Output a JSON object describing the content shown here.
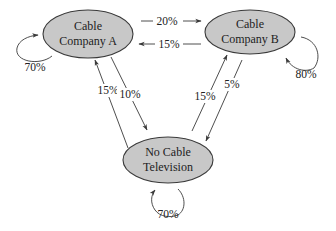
{
  "diagram": {
    "type": "state-transition",
    "nodes": [
      {
        "id": "A",
        "line1": "Cable",
        "line2": "Company A",
        "fill": "#c8c8c8"
      },
      {
        "id": "B",
        "line1": "Cable",
        "line2": "Company B",
        "fill": "#c8c8c8"
      },
      {
        "id": "C",
        "line1": "No Cable",
        "line2": "Television",
        "fill": "#c8c8c8"
      }
    ],
    "edges": [
      {
        "from": "A",
        "to": "B",
        "label": "20%"
      },
      {
        "from": "B",
        "to": "A",
        "label": "15%"
      },
      {
        "from": "A",
        "to": "A",
        "label": "70%"
      },
      {
        "from": "B",
        "to": "B",
        "label": "80%"
      },
      {
        "from": "C",
        "to": "A",
        "label": "15%"
      },
      {
        "from": "A",
        "to": "C",
        "label": "10%"
      },
      {
        "from": "C",
        "to": "B",
        "label": "15%"
      },
      {
        "from": "B",
        "to": "C",
        "label": "5%"
      },
      {
        "from": "C",
        "to": "C",
        "label": "70%"
      }
    ]
  }
}
